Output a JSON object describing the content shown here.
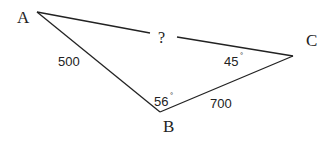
{
  "diagram": {
    "type": "triangle",
    "vertices": {
      "A": "A",
      "B": "B",
      "C": "C"
    },
    "sides": {
      "AB": "500",
      "BC": "700",
      "AC": "?"
    },
    "angles": {
      "B": "56",
      "C": "45"
    },
    "degree_symbol": "°",
    "line_color": "#222222"
  }
}
